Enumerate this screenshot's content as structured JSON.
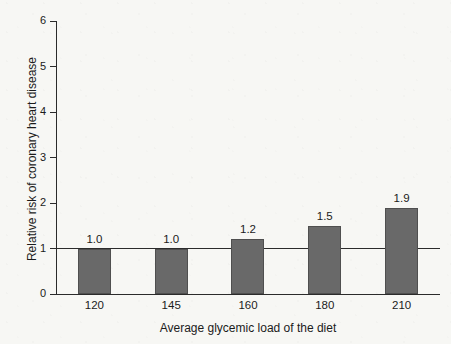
{
  "chart_data": {
    "type": "bar",
    "title": "",
    "subtitle": "",
    "xlabel": "Average glycemic load of the diet",
    "ylabel": "Relative risk of coronary heart disease",
    "categories": [
      "120",
      "145",
      "160",
      "180",
      "210"
    ],
    "values": [
      1.0,
      1.2,
      1.5,
      1.9,
      1.0
    ],
    "value_labels": [
      "1.0",
      "1.0",
      "1.2",
      "1.5",
      "1.9"
    ],
    "series": [
      {
        "name": "Relative risk of coronary heart disease",
        "values": [
          1.0,
          1.0,
          1.2,
          1.5,
          1.9
        ]
      }
    ],
    "ylim": [
      0,
      6
    ],
    "xlim_categories": 5,
    "y_ticks": [
      "0",
      "1",
      "2",
      "3",
      "4",
      "5",
      "6"
    ],
    "y_tick_values": [
      0,
      1,
      2,
      3,
      4,
      5,
      6
    ],
    "grid": false,
    "legend": false,
    "legend_position": "none",
    "annotations": [
      {
        "name": "reference-line",
        "type": "hline",
        "y": 1,
        "label": ""
      }
    ],
    "bar_color": "#696969",
    "bar_edge_color": "#4f4f4f",
    "axis_color": "#2b2b2b",
    "background_color": "#f7f7f4",
    "text_color": "#1b1b1b"
  }
}
